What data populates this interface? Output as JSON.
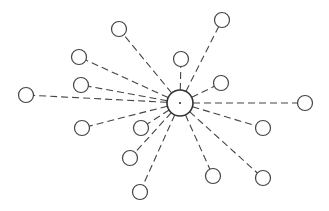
{
  "diagram": {
    "type": "star-network",
    "edge_style": "dashed",
    "colors": {
      "stroke": "#444444",
      "background": "#ffffff"
    },
    "hub": {
      "id": "hub",
      "x": 180,
      "y": 103,
      "r": 13,
      "center_dot": true
    },
    "leaves": [
      {
        "id": "n1",
        "x": 222,
        "y": 20,
        "r": 7.5
      },
      {
        "id": "n2",
        "x": 119,
        "y": 29,
        "r": 7.5
      },
      {
        "id": "n3",
        "x": 79,
        "y": 57,
        "r": 7.5
      },
      {
        "id": "n4",
        "x": 181,
        "y": 59,
        "r": 7.5
      },
      {
        "id": "n5",
        "x": 81,
        "y": 85,
        "r": 7.5
      },
      {
        "id": "n6",
        "x": 221,
        "y": 83,
        "r": 7.5
      },
      {
        "id": "n7",
        "x": 26,
        "y": 95,
        "r": 7.5
      },
      {
        "id": "n8",
        "x": 305,
        "y": 103,
        "r": 7.5
      },
      {
        "id": "n9",
        "x": 82,
        "y": 128,
        "r": 7.5
      },
      {
        "id": "n10",
        "x": 141,
        "y": 128,
        "r": 7.5
      },
      {
        "id": "n11",
        "x": 263,
        "y": 128,
        "r": 7.5
      },
      {
        "id": "n12",
        "x": 130,
        "y": 158,
        "r": 7.5
      },
      {
        "id": "n13",
        "x": 213,
        "y": 176,
        "r": 7.5
      },
      {
        "id": "n14",
        "x": 263,
        "y": 178,
        "r": 7.5
      },
      {
        "id": "n15",
        "x": 140,
        "y": 192,
        "r": 7.5
      }
    ]
  }
}
